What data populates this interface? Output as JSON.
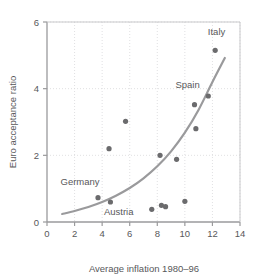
{
  "chart_data": {
    "type": "scatter",
    "title": "",
    "xlabel": "Average inflation 1980–96",
    "ylabel": "Euro acceptance ratio",
    "xlim": [
      0,
      14
    ],
    "ylim": [
      0,
      6
    ],
    "xticks": [
      0,
      2,
      4,
      6,
      8,
      10,
      12,
      14
    ],
    "yticks": [
      0,
      2,
      4,
      6
    ],
    "xtick_labels": [
      "0",
      "2",
      "4",
      "6",
      "8",
      "10",
      "12",
      "14"
    ],
    "ytick_labels": [
      "0",
      "2",
      "4",
      "6"
    ],
    "grid": true,
    "grid_style": "dotted",
    "legend": "none",
    "point_color": "#6b6b6d",
    "curve_color": "#9a9a9c",
    "axis_color": "#9a9a9c",
    "text_color": "#58585a",
    "background": "#ffffff",
    "points": [
      {
        "x": 3.7,
        "y": 0.73,
        "label": "Germany"
      },
      {
        "x": 4.6,
        "y": 0.6,
        "label": "Austria"
      },
      {
        "x": 4.5,
        "y": 2.2,
        "label": ""
      },
      {
        "x": 5.7,
        "y": 3.02,
        "label": ""
      },
      {
        "x": 7.6,
        "y": 0.38,
        "label": ""
      },
      {
        "x": 8.3,
        "y": 0.5,
        "label": ""
      },
      {
        "x": 8.6,
        "y": 0.46,
        "label": ""
      },
      {
        "x": 8.2,
        "y": 2.0,
        "label": ""
      },
      {
        "x": 9.4,
        "y": 1.88,
        "label": ""
      },
      {
        "x": 10.0,
        "y": 0.62,
        "label": ""
      },
      {
        "x": 10.8,
        "y": 2.8,
        "label": ""
      },
      {
        "x": 10.7,
        "y": 3.52,
        "label": "Spain"
      },
      {
        "x": 11.7,
        "y": 3.78,
        "label": ""
      },
      {
        "x": 12.2,
        "y": 5.15,
        "label": "Italy"
      }
    ],
    "annotations": [
      {
        "text": "Italy",
        "x": 12.3,
        "y": 5.62
      },
      {
        "text": "Spain",
        "x": 10.2,
        "y": 4.02
      },
      {
        "text": "Germany",
        "x": 2.4,
        "y": 1.1
      },
      {
        "text": "Austria",
        "x": 5.2,
        "y": 0.22
      }
    ],
    "fit_curve": {
      "description": "exponential trend line",
      "x_start": 1.1,
      "x_end": 12.9,
      "y_start": 0.24,
      "y_end": 4.92,
      "points": [
        {
          "x": 1.1,
          "y": 0.24
        },
        {
          "x": 2.0,
          "y": 0.33
        },
        {
          "x": 3.0,
          "y": 0.45
        },
        {
          "x": 4.0,
          "y": 0.6
        },
        {
          "x": 5.0,
          "y": 0.79
        },
        {
          "x": 6.0,
          "y": 1.02
        },
        {
          "x": 7.0,
          "y": 1.31
        },
        {
          "x": 8.0,
          "y": 1.67
        },
        {
          "x": 9.0,
          "y": 2.12
        },
        {
          "x": 10.0,
          "y": 2.68
        },
        {
          "x": 11.0,
          "y": 3.37
        },
        {
          "x": 12.0,
          "y": 4.2
        },
        {
          "x": 12.9,
          "y": 4.92
        }
      ]
    }
  }
}
